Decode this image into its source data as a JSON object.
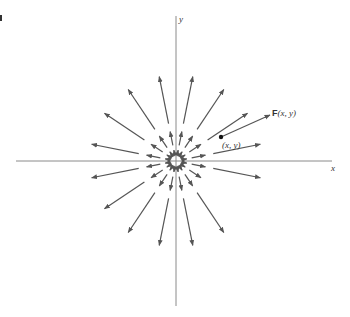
{
  "figure": {
    "type": "vector-field",
    "labels": {
      "x_axis": "x",
      "y_axis": "y",
      "field": "F(x, y)",
      "point": "(x, y)"
    },
    "colors": {
      "axis": "#8a8a8a",
      "arrow": "#555555",
      "point": "#111111"
    },
    "origin": [
      176,
      161
    ],
    "point": [
      221,
      137
    ],
    "field_arrow_end": [
      270,
      115
    ]
  }
}
